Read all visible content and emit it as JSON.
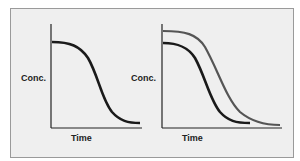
{
  "panels": [
    {
      "ylabel": "Conc.",
      "xlabel": "Time",
      "curves": 1
    },
    {
      "ylabel": "Conc.",
      "xlabel": "Time",
      "curves": 2
    }
  ],
  "colors": {
    "background": "#efefef",
    "border": "#9a9a9a",
    "curve_primary": "#1a1a1a",
    "curve_secondary": "#555555"
  }
}
